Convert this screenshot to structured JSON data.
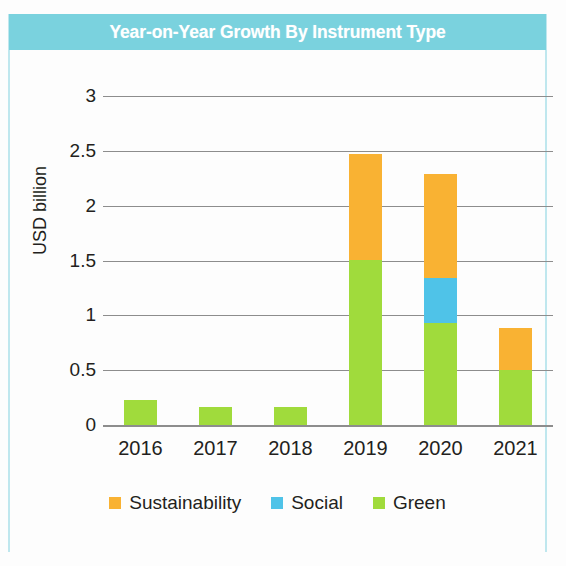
{
  "title": "Year-on-Year Growth By Instrument Type",
  "theme": {
    "title_bar": "#7ad2de",
    "title_text": "#ffffff",
    "grid": "#8d8d8d",
    "text": "#231f20",
    "plate_edge": "#bfe7ee"
  },
  "chart_data": {
    "type": "bar",
    "stacked": true,
    "title": "Year-on-Year Growth By Instrument Type",
    "xlabel": "",
    "ylabel": "USD billion",
    "categories": [
      "2016",
      "2017",
      "2018",
      "2019",
      "2020",
      "2021"
    ],
    "ylim": [
      0,
      3
    ],
    "yticks": [
      "0",
      "0.5",
      "1",
      "1.5",
      "2",
      "2.5",
      "3"
    ],
    "ytick_values": [
      0,
      0.5,
      1,
      1.5,
      2,
      2.5,
      3
    ],
    "grid": "horizontal",
    "legend_position": "bottom",
    "series": [
      {
        "name": "Green",
        "color": "#a0db3c",
        "values": [
          0.23,
          0.16,
          0.16,
          1.5,
          0.93,
          0.5
        ]
      },
      {
        "name": "Social",
        "color": "#4fc3e8",
        "values": [
          0,
          0,
          0,
          0,
          0.41,
          0
        ]
      },
      {
        "name": "Sustainability",
        "color": "#f9b233",
        "values": [
          0,
          0,
          0,
          0.97,
          0.95,
          0.38
        ]
      }
    ],
    "totals": [
      0.23,
      0.16,
      0.16,
      2.47,
      2.29,
      0.88
    ]
  },
  "legend": [
    {
      "label": "Sustainability",
      "color": "#f9b233",
      "swatch": "legend-swatch-sustainability"
    },
    {
      "label": "Social",
      "color": "#4fc3e8",
      "swatch": "legend-swatch-social"
    },
    {
      "label": "Green",
      "color": "#a0db3c",
      "swatch": "legend-swatch-green"
    }
  ]
}
